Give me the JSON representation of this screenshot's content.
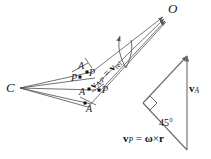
{
  "figure": {
    "type": "kinematics-vector-diagram",
    "background": "#ffffff",
    "ink": "#1a1a1a",
    "points": {
      "O": "O",
      "C": "C",
      "A_upper": "A",
      "A_middle": "A",
      "A_lower": "A",
      "P_upper_left": "P",
      "P_upper_right": "P",
      "P_right": "P"
    },
    "vectors": {
      "relative_lead": "v",
      "relative_sub": "A/P",
      "relative_eq": "=",
      "relative_rhs_lead": "v",
      "relative_rhs_sub": "rel",
      "absolute_lead": "v",
      "absolute_sub": "A",
      "driven_lead": "v",
      "driven_sub": "P",
      "driven_eq": "=",
      "driven_omega": "ω",
      "driven_cross": "×",
      "driven_r": "r"
    },
    "angles": {
      "corner_angle": "45°",
      "right_angle_marker": "square-marker"
    }
  }
}
